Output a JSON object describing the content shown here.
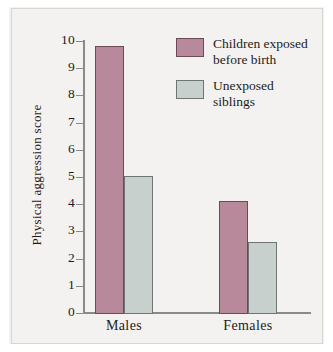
{
  "chart_data": {
    "type": "bar",
    "title": "",
    "subtitle": "",
    "xlabel": "",
    "ylabel": "Physical aggression score",
    "categories": [
      "Males",
      "Females"
    ],
    "series": [
      {
        "name": "Children exposed before birth",
        "legend_lines": [
          "Children exposed",
          "before birth"
        ],
        "color": "#b8899a",
        "border_color": "#6b4b56",
        "values": [
          9.8,
          4.1
        ]
      },
      {
        "name": "Unexposed siblings",
        "legend_lines": [
          "Unexposed",
          "siblings"
        ],
        "color": "#c8d0cd",
        "border_color": "#6f7573",
        "values": [
          5.05,
          2.6
        ]
      }
    ],
    "ylim": [
      0,
      10
    ],
    "ytick_labels": [
      "0",
      "1",
      "2",
      "3",
      "4",
      "5",
      "6",
      "7",
      "8",
      "9",
      "10"
    ],
    "ytick_values": [
      0,
      1,
      2,
      3,
      4,
      5,
      6,
      7,
      8,
      9,
      10
    ],
    "grid": false,
    "legend_position": "top-right",
    "background_color": "#f4f2f0",
    "axis_color": "#8a8a88"
  }
}
